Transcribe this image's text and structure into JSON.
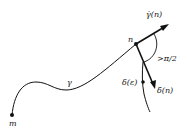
{
  "labels": {
    "start_point": "m",
    "end_point": "n",
    "curve": "γ",
    "tangent": "γ̇(n)",
    "angle": ">π/2",
    "delta_point": "δ(ε)",
    "delta_tangent": "δ̇(n)"
  },
  "colors": {
    "ink": "#111111",
    "background": "#ffffff"
  }
}
